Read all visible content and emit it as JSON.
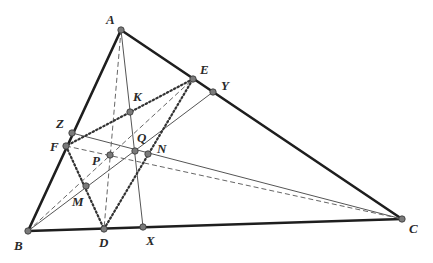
{
  "diagram": {
    "type": "triangle-geometry",
    "points": {
      "A": {
        "label": "A",
        "x": 121,
        "y": 30,
        "lx": 106,
        "ly": 24
      },
      "B": {
        "label": "B",
        "x": 28,
        "y": 231,
        "lx": 14,
        "ly": 250
      },
      "C": {
        "label": "C",
        "x": 402,
        "y": 219,
        "lx": 409,
        "ly": 233
      },
      "D": {
        "label": "D",
        "x": 104,
        "y": 229,
        "lx": 99,
        "ly": 247
      },
      "E": {
        "label": "E",
        "x": 193,
        "y": 79,
        "lx": 200,
        "ly": 74
      },
      "F": {
        "label": "F",
        "x": 66,
        "y": 146,
        "lx": 50,
        "ly": 151
      },
      "X": {
        "label": "X",
        "x": 143,
        "y": 227,
        "lx": 146,
        "ly": 245
      },
      "Y": {
        "label": "Y",
        "x": 213,
        "y": 92,
        "lx": 221,
        "ly": 90
      },
      "Z": {
        "label": "Z",
        "x": 72,
        "y": 133,
        "lx": 56,
        "ly": 128
      },
      "K": {
        "label": "K",
        "x": 130,
        "y": 112,
        "lx": 133,
        "ly": 101
      },
      "Q": {
        "label": "Q",
        "x": 135,
        "y": 151,
        "lx": 137,
        "ly": 142
      },
      "N": {
        "label": "N",
        "x": 148,
        "y": 154,
        "lx": 157,
        "ly": 153
      },
      "P": {
        "label": "P",
        "x": 110,
        "y": 155,
        "lx": 92,
        "ly": 165
      },
      "M": {
        "label": "M",
        "x": 86,
        "y": 186,
        "lx": 72,
        "ly": 206
      }
    },
    "segments": {
      "triangle": [
        "A-B",
        "B-C",
        "C-A"
      ],
      "dotted": [
        "D-E",
        "E-F",
        "F-D",
        "K-E"
      ],
      "solid": [
        "A-X",
        "Z-C",
        "B-Y"
      ],
      "dashed": [
        "A-D",
        "B-E",
        "F-C"
      ]
    }
  }
}
